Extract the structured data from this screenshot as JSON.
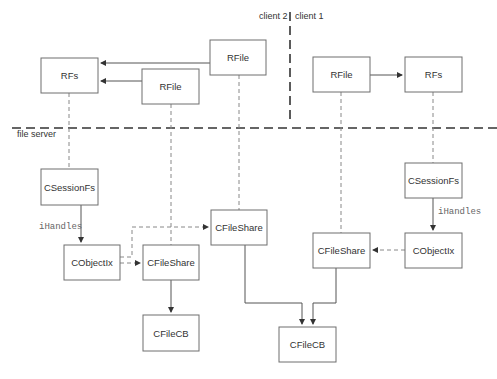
{
  "diagram": {
    "regions": {
      "client2": "client 2",
      "client1": "client 1",
      "file_server": "file server"
    },
    "edge_labels": {
      "left_handles": "iHandles",
      "right_handles": "iHandles"
    },
    "nodes": {
      "rfs_left": "RFs",
      "rfile_top": "RFile",
      "rfile_mid": "RFile",
      "rfile_client1": "RFile",
      "rfs_client1": "RFs",
      "csessionfs_left": "CSessionFs",
      "cobjectix_left": "CObjectIx",
      "cfileshare_midleft": "CFileShare",
      "cfilecb_left": "CFileCB",
      "cfileshare_center": "CFileShare",
      "cfileshare_client1": "CFileShare",
      "csessionfs_right": "CSessionFs",
      "cobjectix_right": "CObjectIx",
      "cfilecb_center": "CFileCB"
    },
    "colors": {
      "box_stroke": "#6e6e6e",
      "solid_line": "#555555",
      "dashed_line": "#888888",
      "boundary": "#333333"
    }
  }
}
